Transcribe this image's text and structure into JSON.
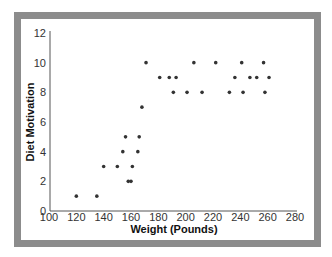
{
  "chart_data": {
    "type": "scatter",
    "title": "",
    "xlabel": "Weight (Pounds)",
    "ylabel": "Diet Motivation",
    "xlim": [
      100,
      280
    ],
    "ylim": [
      0,
      12
    ],
    "x_ticks": [
      100,
      120,
      140,
      160,
      180,
      200,
      220,
      240,
      260,
      280
    ],
    "y_ticks": [
      0,
      2,
      4,
      6,
      8,
      10,
      12
    ],
    "grid": false,
    "legend": null,
    "marker_color": "#333333",
    "points": [
      {
        "x": 120,
        "y": 1
      },
      {
        "x": 135,
        "y": 1
      },
      {
        "x": 140,
        "y": 3
      },
      {
        "x": 150,
        "y": 3
      },
      {
        "x": 161,
        "y": 3
      },
      {
        "x": 158,
        "y": 2
      },
      {
        "x": 160,
        "y": 2
      },
      {
        "x": 154,
        "y": 4
      },
      {
        "x": 165,
        "y": 4
      },
      {
        "x": 156,
        "y": 5
      },
      {
        "x": 166,
        "y": 5
      },
      {
        "x": 168,
        "y": 7
      },
      {
        "x": 171,
        "y": 10
      },
      {
        "x": 206,
        "y": 10
      },
      {
        "x": 222,
        "y": 10
      },
      {
        "x": 241,
        "y": 10
      },
      {
        "x": 257,
        "y": 10
      },
      {
        "x": 181,
        "y": 9
      },
      {
        "x": 188,
        "y": 9
      },
      {
        "x": 193,
        "y": 9
      },
      {
        "x": 236,
        "y": 9
      },
      {
        "x": 247,
        "y": 9
      },
      {
        "x": 252,
        "y": 9
      },
      {
        "x": 261,
        "y": 9
      },
      {
        "x": 191,
        "y": 8
      },
      {
        "x": 201,
        "y": 8
      },
      {
        "x": 212,
        "y": 8
      },
      {
        "x": 232,
        "y": 8
      },
      {
        "x": 242,
        "y": 8
      },
      {
        "x": 258,
        "y": 8
      }
    ]
  },
  "colors": {
    "frame": "#8c8c8c",
    "axis": "#555555",
    "marker": "#333333"
  }
}
